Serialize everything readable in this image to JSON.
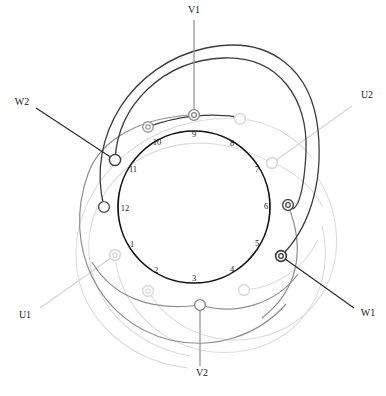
{
  "diagram": {
    "geometry": {
      "center_x": 194,
      "center_y": 207,
      "stator_radius": 76,
      "slot_count": 12,
      "slot_number_radius": 64,
      "first_slot_angle_deg": 195,
      "slot_step_deg": 30
    },
    "colors": {
      "stator": "#111111",
      "phase_v": "#4a4a4a",
      "phase_w": "#2b2b2b",
      "phase_u": "#d8d8d8",
      "phase_u_mid": "#bdbdbd",
      "label_dark": "#1a1a1a",
      "label_light": "#cfcfcf",
      "background": "#ffffff"
    }
  },
  "slots": {
    "label": "slot numbers",
    "numbers": [
      "1",
      "2",
      "3",
      "4",
      "5",
      "6",
      "7",
      "8",
      "9",
      "10",
      "11",
      "12"
    ]
  },
  "terminals": [
    {
      "id": "V1",
      "label": "V1",
      "phase": "V",
      "kind": "lead-out",
      "color": "#4a4a4a",
      "node_x": 194,
      "node_y": 115,
      "label_x": 194,
      "label_y": 11,
      "node_style": "double-ring"
    },
    {
      "id": "V2",
      "label": "V2",
      "phase": "V",
      "kind": "lead-out",
      "color": "#808080",
      "node_x": 200,
      "node_y": 305,
      "label_x": 202,
      "label_y": 374,
      "node_style": "ring"
    },
    {
      "id": "W1",
      "label": "W1",
      "phase": "W",
      "kind": "lead-out",
      "color": "#2b2b2b",
      "node_x": 281,
      "node_y": 256,
      "label_x": 368,
      "label_y": 314,
      "node_style": "double-ring"
    },
    {
      "id": "W2",
      "label": "W2",
      "phase": "W",
      "kind": "lead-out",
      "color": "#2b2b2b",
      "node_x": 115,
      "node_y": 160,
      "label_x": 22,
      "label_y": 103,
      "node_style": "ring"
    },
    {
      "id": "U1",
      "label": "U1",
      "phase": "U",
      "kind": "lead-out",
      "color": "#cfcfcf",
      "node_x": 115,
      "node_y": 255,
      "label_x": 25,
      "label_y": 316,
      "node_style": "ring-light"
    },
    {
      "id": "U2",
      "label": "U2",
      "phase": "U",
      "kind": "lead-out",
      "color": "#cfcfcf",
      "node_x": 272,
      "node_y": 163,
      "label_x": 367,
      "label_y": 96,
      "node_style": "ring-light"
    }
  ],
  "coil_nodes": [
    {
      "id": "w-node-12",
      "phase": "W",
      "x": 104,
      "y": 207,
      "style": "ring",
      "color": "#2b2b2b"
    },
    {
      "id": "w-node-10",
      "phase": "W",
      "x": 148,
      "y": 127,
      "style": "double-ring",
      "color": "#7a7a7a"
    },
    {
      "id": "v-node-6",
      "phase": "V",
      "x": 288,
      "y": 205,
      "style": "double-ring",
      "color": "#4a4a4a"
    },
    {
      "id": "u-node-8",
      "phase": "U",
      "x": 240,
      "y": 119,
      "style": "ring-light",
      "color": "#dcdcdc"
    },
    {
      "id": "u-node-2",
      "phase": "U",
      "x": 148,
      "y": 291,
      "style": "ring-light",
      "color": "#dcdcdc"
    },
    {
      "id": "u-node-4",
      "phase": "U",
      "x": 244,
      "y": 290,
      "style": "ring-light",
      "color": "#dcdcdc"
    }
  ],
  "phases": [
    {
      "name": "U",
      "label": "U phase",
      "color": "#d8d8d8",
      "terminals": [
        "U1",
        "U2"
      ]
    },
    {
      "name": "V",
      "label": "V phase",
      "color": "#4a4a4a",
      "terminals": [
        "V1",
        "V2"
      ]
    },
    {
      "name": "W",
      "label": "W phase",
      "color": "#2b2b2b",
      "terminals": [
        "W1",
        "W2"
      ]
    }
  ]
}
